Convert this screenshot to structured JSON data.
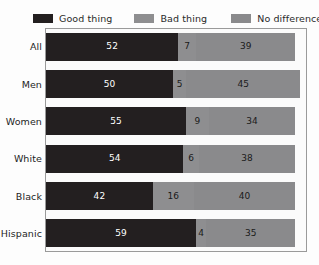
{
  "chart_data": {
    "type": "bar",
    "subtype": "horizontal-stacked-100",
    "title": "",
    "subtitle": "",
    "xlabel": "",
    "ylabel": "",
    "xlim": [
      0,
      100
    ],
    "grid": false,
    "legend_position": "top",
    "categories": [
      "All",
      "Men",
      "Women",
      "White",
      "Black",
      "Hispanic"
    ],
    "series": [
      {
        "name": "Good thing",
        "color": "#231f20",
        "values": [
          52,
          50,
          55,
          54,
          42,
          59
        ]
      },
      {
        "name": "Bad thing",
        "color": "#8e8e90",
        "values": [
          7,
          5,
          9,
          6,
          16,
          4
        ]
      },
      {
        "name": "No difference",
        "color": "#8a8a8c",
        "values": [
          39,
          45,
          34,
          38,
          40,
          35
        ]
      }
    ]
  },
  "legend": {
    "items": [
      {
        "label": "Good thing",
        "color": "#231f20"
      },
      {
        "label": "Bad thing",
        "color": "#8e8e90"
      },
      {
        "label": "No difference",
        "color": "#8a8a8c"
      }
    ]
  },
  "rows": [
    {
      "label": "All",
      "values": [
        52,
        7,
        39
      ]
    },
    {
      "label": "Men",
      "values": [
        50,
        5,
        45
      ]
    },
    {
      "label": "Women",
      "values": [
        55,
        9,
        34
      ]
    },
    {
      "label": "White",
      "values": [
        54,
        6,
        38
      ]
    },
    {
      "label": "Black",
      "values": [
        42,
        16,
        40
      ]
    },
    {
      "label": "Hispanic",
      "values": [
        59,
        4,
        35
      ]
    }
  ]
}
